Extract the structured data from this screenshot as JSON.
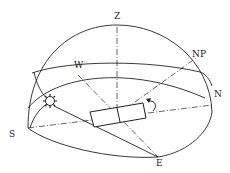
{
  "diagram": {
    "labels": {
      "zenith": "Z",
      "north_pole": "NP",
      "west": "W",
      "north": "N",
      "south": "S",
      "east": "E"
    },
    "icons": {
      "sun": "sun-icon",
      "tracker": "tracker-panel-icon",
      "rotation": "rotation-arrow-icon"
    },
    "colors": {
      "stroke": "#222222",
      "background": "#ffffff"
    }
  }
}
